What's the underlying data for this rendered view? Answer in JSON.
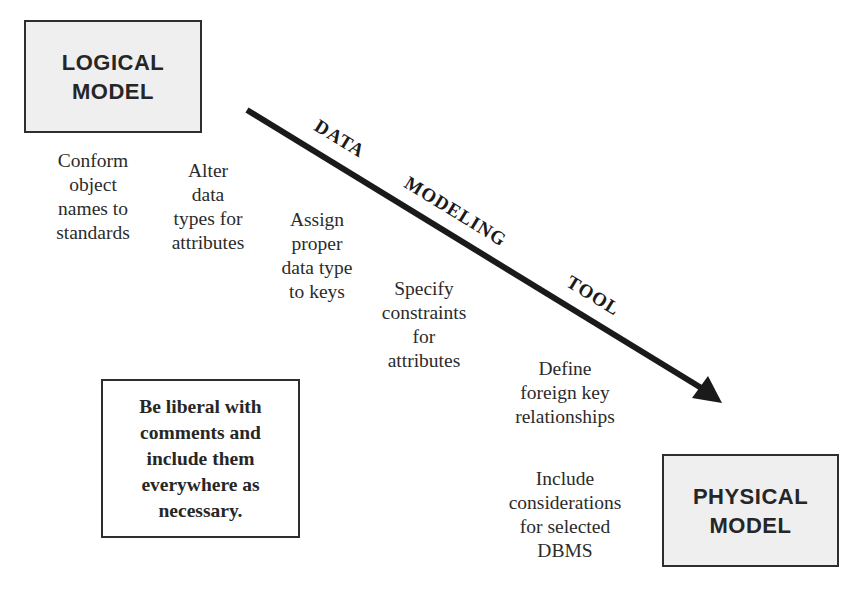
{
  "diagram": {
    "logical_model": {
      "line1": "LOGICAL",
      "line2": "MODEL"
    },
    "physical_model": {
      "line1": "PHYSICAL",
      "line2": "MODEL"
    },
    "arrow": {
      "label_word1": "DATA",
      "label_word2": "MODELING",
      "label_word3": "TOOL",
      "color": "#1a1a1a"
    },
    "steps": [
      {
        "lines": [
          "Conform",
          "object",
          "names to",
          "standards"
        ]
      },
      {
        "lines": [
          "Alter",
          "data",
          "types for",
          "attributes"
        ]
      },
      {
        "lines": [
          "Assign",
          "proper",
          "data type",
          "to keys"
        ]
      },
      {
        "lines": [
          "Specify",
          "constraints",
          "for",
          "attributes"
        ]
      },
      {
        "lines": [
          "Define",
          "foreign key",
          "relationships"
        ]
      },
      {
        "lines": [
          "Include",
          "considerations",
          "for selected",
          "DBMS"
        ]
      }
    ],
    "comment_note": {
      "lines": [
        "Be liberal with",
        "comments and",
        "include them",
        "everywhere as",
        "necessary."
      ]
    },
    "colors": {
      "box_fill": "#efefef",
      "border": "#2e2e2e",
      "text": "#2b2b2b"
    }
  }
}
